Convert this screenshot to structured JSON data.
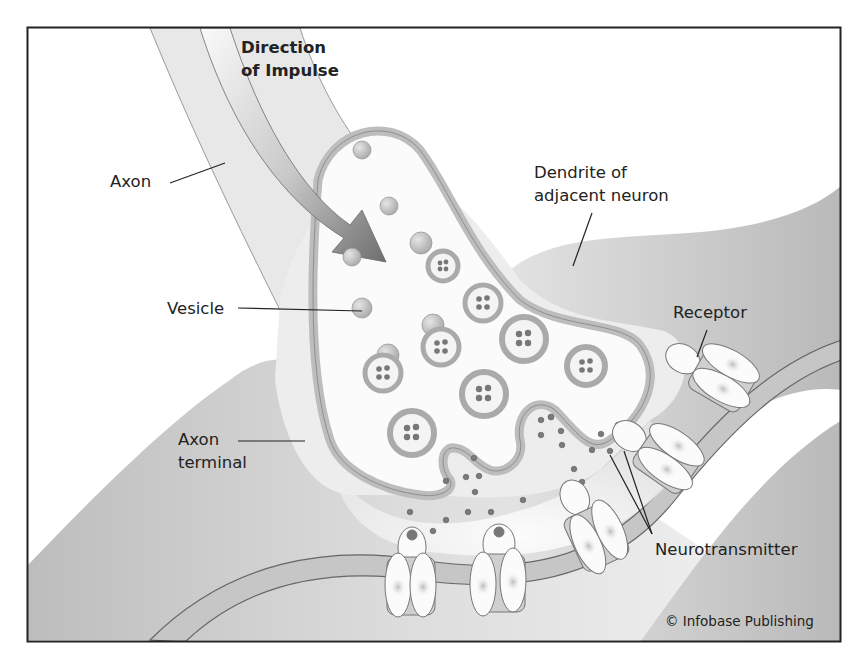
{
  "figure": {
    "frame": {
      "x": 27,
      "y": 27,
      "width": 814,
      "height": 615,
      "stroke": "#222222"
    },
    "colors": {
      "tissue_light": "#eaeaea",
      "tissue_mid": "#d4d4d4",
      "tissue_dark": "#b8b8b8",
      "membrane": "#c2c2c2",
      "membrane_edge": "#8a8a8a",
      "vesicle_ring": "#bdbdbd",
      "vesicle_core": "#f4f4f4",
      "neurotransmitter": "#7a7a7a",
      "receptor_fill": "#fbfbfb",
      "arrow_start": "#f8f8f8",
      "arrow_end": "#7c7c7c",
      "text": "#222222"
    },
    "labels": {
      "direction_line1": "Direction",
      "direction_line2": "of Impulse",
      "axon": "Axon",
      "vesicle": "Vesicle",
      "axon_terminal_line1": "Axon",
      "axon_terminal_line2": "terminal",
      "dendrite_line1": "Dendrite of",
      "dendrite_line2": "adjacent neuron",
      "receptor": "Receptor",
      "neurotransmitter": "Neurotransmitter"
    },
    "credit": "© Infobase Publishing"
  }
}
